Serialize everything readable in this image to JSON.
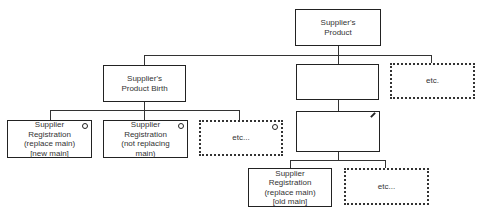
{
  "diagram": {
    "nodes": {
      "root": {
        "label": "Supplier's\nProduct"
      },
      "birth": {
        "label": "Supplier's\nProduct Birth"
      },
      "blank_mid": {
        "label": ""
      },
      "etc_top": {
        "label": "etc."
      },
      "reg_new_main": {
        "label": "Supplier\nRegistration\n(replace main)\n[new main]"
      },
      "reg_not_replacing": {
        "label": "Supplier\nRegistration\n(not replacing\nmain)"
      },
      "etc_left": {
        "label": "etc..."
      },
      "blank_edit": {
        "label": ""
      },
      "reg_old_main": {
        "label": "Supplier\nRegistration\n(replace main)\n[old main]"
      },
      "etc_bottom": {
        "label": "etc..."
      }
    }
  }
}
